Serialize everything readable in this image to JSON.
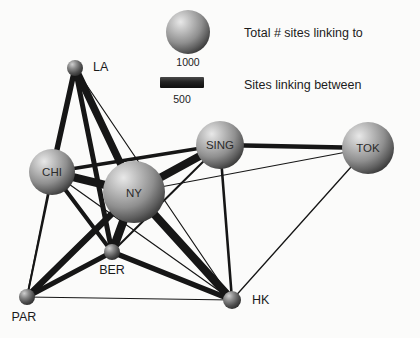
{
  "chart_data": {
    "type": "diagram",
    "title": "",
    "subtype": "network-graph",
    "legend": {
      "position": "top-right",
      "entries": [
        {
          "symbol": "sphere",
          "label": "Total # sites linking to",
          "value": "1000",
          "name": "node-size-legend"
        },
        {
          "symbol": "bar",
          "label": "Sites linking between",
          "value": "500",
          "name": "edge-width-legend"
        }
      ]
    },
    "nodes": [
      {
        "id": "LA",
        "label": "LA",
        "x": 75,
        "y": 68,
        "r": 8,
        "value": 220,
        "label_dx": 18,
        "label_dy": 3,
        "label_anchor": "start"
      },
      {
        "id": "CHI",
        "label": "CHI",
        "x": 52,
        "y": 172,
        "r": 23,
        "value": 900,
        "label_dx": 0,
        "label_dy": 4,
        "label_anchor": "middle",
        "inside": true
      },
      {
        "id": "NY",
        "label": "NY",
        "x": 134,
        "y": 192,
        "r": 31,
        "value": 1250,
        "label_dx": 0,
        "label_dy": 5,
        "label_anchor": "middle",
        "inside": true
      },
      {
        "id": "SING",
        "label": "SING",
        "x": 220,
        "y": 145,
        "r": 24,
        "value": 950,
        "label_dx": 0,
        "label_dy": 4,
        "label_anchor": "middle",
        "inside": true
      },
      {
        "id": "TOK",
        "label": "TOK",
        "x": 368,
        "y": 148,
        "r": 26,
        "value": 1000,
        "label_dx": 0,
        "label_dy": 4,
        "label_anchor": "middle",
        "inside": true
      },
      {
        "id": "BER",
        "label": "BER",
        "x": 112,
        "y": 252,
        "r": 8,
        "value": 210,
        "label_dx": 0,
        "label_dy": 22,
        "label_anchor": "middle"
      },
      {
        "id": "PAR",
        "label": "PAR",
        "x": 27,
        "y": 297,
        "r": 8,
        "value": 200,
        "label_dx": -3,
        "label_dy": 24,
        "label_anchor": "middle"
      },
      {
        "id": "HK",
        "label": "HK",
        "x": 232,
        "y": 300,
        "r": 9,
        "value": 230,
        "label_dx": 20,
        "label_dy": 4,
        "label_anchor": "start"
      }
    ],
    "edges": [
      {
        "source": "LA",
        "target": "CHI",
        "width": 5.5,
        "value": 300
      },
      {
        "source": "LA",
        "target": "NY",
        "width": 7.5,
        "value": 420
      },
      {
        "source": "LA",
        "target": "BER",
        "width": 5.0,
        "value": 270
      },
      {
        "source": "LA",
        "target": "PAR",
        "width": 2.0,
        "value": 110
      },
      {
        "source": "LA",
        "target": "HK",
        "width": 1.2,
        "value": 70
      },
      {
        "source": "CHI",
        "target": "NY",
        "width": 8.0,
        "value": 450
      },
      {
        "source": "CHI",
        "target": "BER",
        "width": 4.0,
        "value": 220
      },
      {
        "source": "CHI",
        "target": "PAR",
        "width": 1.6,
        "value": 90
      },
      {
        "source": "CHI",
        "target": "HK",
        "width": 1.2,
        "value": 70
      },
      {
        "source": "CHI",
        "target": "SING",
        "width": 3.5,
        "value": 190
      },
      {
        "source": "NY",
        "target": "BER",
        "width": 8.5,
        "value": 470
      },
      {
        "source": "NY",
        "target": "PAR",
        "width": 6.5,
        "value": 360
      },
      {
        "source": "NY",
        "target": "SING",
        "width": 8.0,
        "value": 450
      },
      {
        "source": "NY",
        "target": "HK",
        "width": 8.0,
        "value": 450
      },
      {
        "source": "NY",
        "target": "TOK",
        "width": 1.1,
        "value": 60
      },
      {
        "source": "BER",
        "target": "PAR",
        "width": 5.0,
        "value": 270
      },
      {
        "source": "BER",
        "target": "HK",
        "width": 5.5,
        "value": 300
      },
      {
        "source": "BER",
        "target": "SING",
        "width": 2.0,
        "value": 110
      },
      {
        "source": "PAR",
        "target": "HK",
        "width": 1.1,
        "value": 60
      },
      {
        "source": "SING",
        "target": "TOK",
        "width": 4.5,
        "value": 250
      },
      {
        "source": "SING",
        "target": "HK",
        "width": 2.6,
        "value": 140
      },
      {
        "source": "TOK",
        "target": "HK",
        "width": 1.3,
        "value": 75
      }
    ],
    "colors": {
      "background": "#fbfbfa",
      "edge": "#161616",
      "node_light": "#d8d8d8",
      "node_mid": "#9a9a9a",
      "node_dark": "#4a4a4a",
      "text": "#1a1a1a"
    }
  }
}
